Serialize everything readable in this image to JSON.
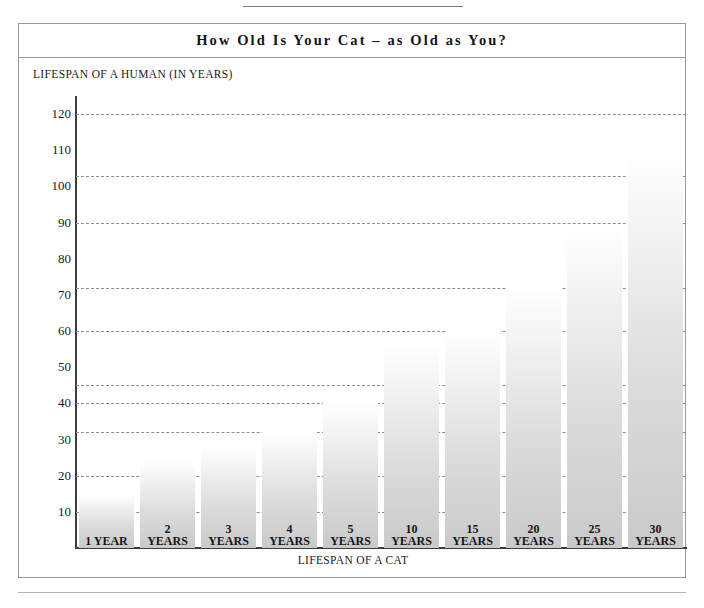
{
  "chart_data": {
    "type": "bar",
    "title": "How Old Is Your Cat – as Old as You?",
    "xlabel": "LIFESPAN OF A CAT",
    "ylabel": "LIFESPAN OF A HUMAN (IN YEARS)",
    "categories": [
      "1 YEAR",
      "2 YEARS",
      "3 YEARS",
      "4 YEARS",
      "5 YEARS",
      "10 YEARS",
      "15 YEARS",
      "20 YEARS",
      "25 YEARS",
      "30 YEARS"
    ],
    "category_numbers": [
      "1",
      "2",
      "3",
      "4",
      "5",
      "10",
      "15",
      "20",
      "25",
      "30"
    ],
    "category_units": [
      "YEAR",
      "YEARS",
      "YEARS",
      "YEARS",
      "YEARS",
      "YEARS",
      "YEARS",
      "YEARS",
      "YEARS",
      "YEARS"
    ],
    "values": [
      15,
      24,
      28,
      32,
      40,
      56,
      60,
      72,
      89,
      110
    ],
    "gridline_values": [
      120,
      103,
      90,
      72,
      60,
      45,
      40,
      32,
      20,
      10
    ],
    "ytick_labels": [
      "120",
      "110",
      "100",
      "90",
      "80",
      "70",
      "60",
      "50",
      "40",
      "30",
      "20",
      "10"
    ],
    "ytick_values": [
      120,
      110,
      100,
      90,
      80,
      70,
      60,
      50,
      40,
      30,
      20,
      10
    ],
    "ylim": [
      0,
      125
    ],
    "grid": true,
    "legend": "none",
    "bar_color_top": "#ffffff",
    "bar_color_bottom": "#c9c9c9",
    "grid_color": "#8d8d8d",
    "axis_color": "#3d3d3d"
  }
}
